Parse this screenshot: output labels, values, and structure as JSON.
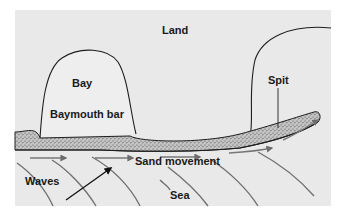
{
  "diagram": {
    "labels": {
      "land": "Land",
      "bay": "Bay",
      "baymouth_bar": "Baymouth bar",
      "spit": "Spit",
      "sand_movement": "Sand movement",
      "waves": "Waves",
      "sea": "Sea"
    },
    "colors": {
      "background": "#e9e9e9",
      "outline": "#1e1e1e",
      "sand_fill": "#bdbdbd",
      "sand_dots": "#555555",
      "wave_lines": "#707070",
      "movement_arrows": "#777777"
    }
  }
}
